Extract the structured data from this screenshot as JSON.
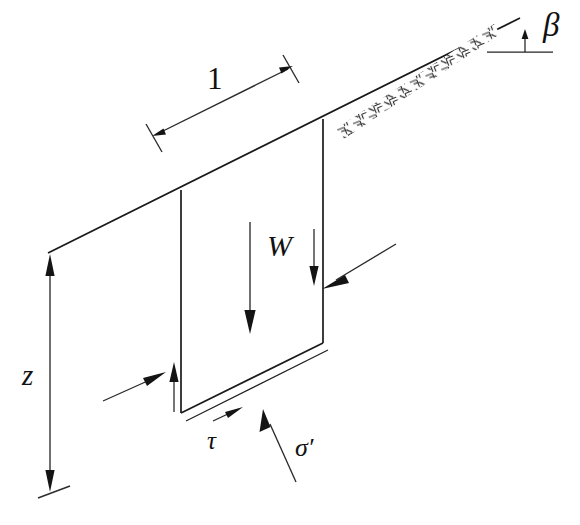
{
  "figure": {
    "background_color": "#ffffff",
    "line_color": "#1a1a1a"
  },
  "labels": {
    "slope_angle": "β",
    "slice_width": "1",
    "weight": "W",
    "depth": "z",
    "shear_stress": "τ",
    "effective_normal_stress": "σ′"
  },
  "annotations": {
    "slope_angle_name": "beta-angle-label",
    "slice_width_name": "slice-width-dimension",
    "weight_name": "weight-force-label",
    "depth_name": "depth-dimension",
    "shear_name": "shear-stress-label",
    "normal_name": "normal-stress-label"
  },
  "elements": {
    "ground_surface": "ground-surface-line",
    "slip_surface": "slip-surface-line",
    "slice_body": "soil-slice-parallelogram",
    "ground_hatching": "ground-hatch-pattern",
    "horizontal_reference": "horizontal-reference-line"
  }
}
